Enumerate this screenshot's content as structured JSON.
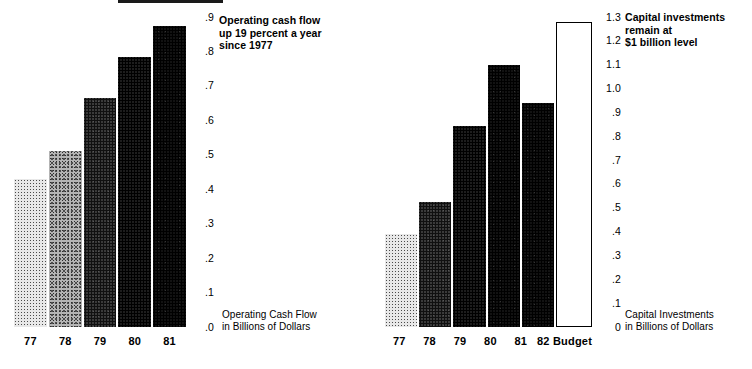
{
  "document": {
    "title": "Operating Cash Flow and Capital Investments",
    "background_color": "#ffffff",
    "ink_color": "#000000"
  },
  "charts": [
    {
      "id": "operating-cash-flow",
      "headline": "Operating cash flow\nup 19 percent a year\nsince 1977",
      "caption": "Operating Cash Flow\nin Billions of Dollars",
      "axis_ticks": [
        ".9",
        ".8",
        ".7",
        ".6",
        ".5",
        ".4",
        ".3",
        ".2",
        ".1",
        ".0"
      ],
      "bars": [
        {
          "label": "77",
          "value": 0.43,
          "tone": "tone-1"
        },
        {
          "label": "78",
          "value": 0.51,
          "tone": "tone-2"
        },
        {
          "label": "79",
          "value": 0.665,
          "tone": "tone-3"
        },
        {
          "label": "80",
          "value": 0.785,
          "tone": "tone-4"
        },
        {
          "label": "81",
          "value": 0.875,
          "tone": "tone-5"
        }
      ]
    },
    {
      "id": "capital-investments",
      "headline": "Capital investments\nremain at\n$1 billion level",
      "caption": "Capital Investments\nin Billions of Dollars",
      "axis_ticks": [
        "1.3",
        "1.2",
        "1.1",
        "1.0",
        ".9",
        ".8",
        ".7",
        ".6",
        ".5",
        ".4",
        ".3",
        ".2",
        ".1",
        "0"
      ],
      "bars": [
        {
          "label": "77",
          "value": 0.39,
          "tone": "tone-1"
        },
        {
          "label": "78",
          "value": 0.525,
          "tone": "tone-3"
        },
        {
          "label": "79",
          "value": 0.845,
          "tone": "tone-4"
        },
        {
          "label": "80",
          "value": 1.1,
          "tone": "tone-5"
        },
        {
          "label": "81",
          "value": 0.94,
          "tone": "tone-5"
        },
        {
          "label": "82 Budget",
          "value": 1.28,
          "tone": "tone-outline"
        }
      ]
    }
  ],
  "chart_data": [
    {
      "type": "bar",
      "title": "Operating cash flow up 19 percent a year since 1977",
      "xlabel": "",
      "ylabel": "Operating Cash Flow in Billions of Dollars",
      "categories": [
        "77",
        "78",
        "79",
        "80",
        "81"
      ],
      "values": [
        0.43,
        0.51,
        0.665,
        0.785,
        0.875
      ],
      "ylim": [
        0.0,
        0.9
      ],
      "ytick_labels": [
        ".0",
        ".1",
        ".2",
        ".3",
        ".4",
        ".5",
        ".6",
        ".7",
        ".8",
        ".9"
      ],
      "ytick_values": [
        0.0,
        0.1,
        0.2,
        0.3,
        0.4,
        0.5,
        0.6,
        0.7,
        0.8,
        0.9
      ],
      "grid": false,
      "legend": "none",
      "annotations": [
        "Operating cash flow up 19 percent a year since 1977"
      ],
      "bar_fills": [
        "light halftone",
        "medium halftone",
        "dark halftone",
        "darker halftone",
        "solid black"
      ]
    },
    {
      "type": "bar",
      "title": "Capital investments remain at $1 billion level",
      "xlabel": "",
      "ylabel": "Capital Investments in Billions of Dollars",
      "categories": [
        "77",
        "78",
        "79",
        "80",
        "81",
        "82 Budget"
      ],
      "values": [
        0.39,
        0.525,
        0.845,
        1.1,
        0.94,
        1.28
      ],
      "ylim": [
        0,
        1.3
      ],
      "ytick_labels": [
        "0",
        ".1",
        ".2",
        ".3",
        ".4",
        ".5",
        ".6",
        ".7",
        ".8",
        ".9",
        "1.0",
        "1.1",
        "1.2",
        "1.3"
      ],
      "ytick_values": [
        0,
        0.1,
        0.2,
        0.3,
        0.4,
        0.5,
        0.6,
        0.7,
        0.8,
        0.9,
        1.0,
        1.1,
        1.2,
        1.3
      ],
      "grid": false,
      "legend": "none",
      "annotations": [
        "Capital investments remain at $1 billion level"
      ],
      "bar_fills": [
        "light halftone",
        "dark halftone",
        "darker halftone",
        "solid black",
        "solid black",
        "white outlined"
      ]
    }
  ]
}
